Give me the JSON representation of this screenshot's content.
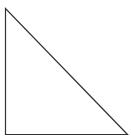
{
  "diagram": {
    "shape": "right-triangle",
    "stroke_color": "#333333",
    "fill_color": "#ffffff",
    "stroke_width": 1.2,
    "vertices": [
      {
        "name": "top",
        "x": 5.5,
        "y": 8.5
      },
      {
        "name": "bottom-left",
        "x": 5.5,
        "y": 134.5
      },
      {
        "name": "bottom-right",
        "x": 127.5,
        "y": 134.5
      }
    ]
  }
}
